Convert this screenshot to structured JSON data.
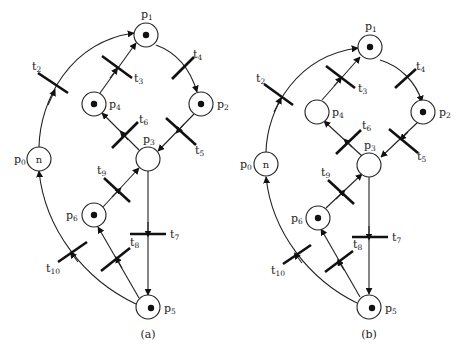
{
  "figure": {
    "type": "petri-net-comparison",
    "panels": [
      {
        "caption": "(a)",
        "places": [
          {
            "id": "p0",
            "name": "p",
            "sub": "0",
            "tokens": "n"
          },
          {
            "id": "p1",
            "name": "p",
            "sub": "1",
            "tokens": 1
          },
          {
            "id": "p2",
            "name": "p",
            "sub": "2",
            "tokens": 1
          },
          {
            "id": "p3",
            "name": "p",
            "sub": "3",
            "tokens": 0
          },
          {
            "id": "p4",
            "name": "p",
            "sub": "4",
            "tokens": 1
          },
          {
            "id": "p5",
            "name": "p",
            "sub": "5",
            "tokens": 1
          },
          {
            "id": "p6",
            "name": "p",
            "sub": "6",
            "tokens": 1
          }
        ]
      },
      {
        "caption": "(b)",
        "places": [
          {
            "id": "p0",
            "name": "p",
            "sub": "0",
            "tokens": "n"
          },
          {
            "id": "p1",
            "name": "p",
            "sub": "1",
            "tokens": 1
          },
          {
            "id": "p2",
            "name": "p",
            "sub": "2",
            "tokens": 1
          },
          {
            "id": "p3",
            "name": "p",
            "sub": "3",
            "tokens": 0
          },
          {
            "id": "p4",
            "name": "p",
            "sub": "4",
            "tokens": 0
          },
          {
            "id": "p5",
            "name": "p",
            "sub": "5",
            "tokens": 1
          },
          {
            "id": "p6",
            "name": "p",
            "sub": "6",
            "tokens": 1
          }
        ]
      }
    ],
    "transitions": [
      {
        "id": "t2",
        "name": "t",
        "sub": "2",
        "from": "p0",
        "to": "p1"
      },
      {
        "id": "t3",
        "name": "t",
        "sub": "3",
        "from": "p4",
        "to": "p1"
      },
      {
        "id": "t4",
        "name": "t",
        "sub": "4",
        "from": "p1",
        "to": "p2"
      },
      {
        "id": "t5",
        "name": "t",
        "sub": "5",
        "from": "p2",
        "to": "p3"
      },
      {
        "id": "t6",
        "name": "t",
        "sub": "6",
        "from": "p3",
        "to": "p4"
      },
      {
        "id": "t7",
        "name": "t",
        "sub": "7",
        "from": "p3",
        "to": "p5"
      },
      {
        "id": "t8",
        "name": "t",
        "sub": "8",
        "from": "p5",
        "to": "p6"
      },
      {
        "id": "t9",
        "name": "t",
        "sub": "9",
        "from": "p6",
        "to": "p3"
      },
      {
        "id": "t10",
        "name": "t",
        "sub": "10",
        "from": "p5",
        "to": "p0"
      }
    ]
  },
  "labels": {
    "a": {
      "p0": "p",
      "p0s": "0",
      "p0tok": "n",
      "p1": "p",
      "p1s": "1",
      "p2": "p",
      "p2s": "2",
      "p3": "p",
      "p3s": "3",
      "p4": "p",
      "p4s": "4",
      "p5": "p",
      "p5s": "5",
      "p6": "p",
      "p6s": "6",
      "t2": "t",
      "t2s": "2",
      "t3": "t",
      "t3s": "3",
      "t4": "t",
      "t4s": "4",
      "t5": "t",
      "t5s": "5",
      "t6": "t",
      "t6s": "6",
      "t7": "t",
      "t7s": "7",
      "t8": "t",
      "t8s": "8",
      "t9": "t",
      "t9s": "9",
      "t10": "t",
      "t10s": "10",
      "caption": "(a)"
    },
    "b": {
      "p0": "p",
      "p0s": "0",
      "p0tok": "n",
      "p1": "p",
      "p1s": "1",
      "p2": "p",
      "p2s": "2",
      "p3": "p",
      "p3s": "3",
      "p4": "p",
      "p4s": "4",
      "p5": "p",
      "p5s": "5",
      "p6": "p",
      "p6s": "6",
      "t2": "t",
      "t2s": "2",
      "t3": "t",
      "t3s": "3",
      "t4": "t",
      "t4s": "4",
      "t5": "t",
      "t5s": "5",
      "t6": "t",
      "t6s": "6",
      "t7": "t",
      "t7s": "7",
      "t8": "t",
      "t8s": "8",
      "t9": "t",
      "t9s": "9",
      "t10": "t",
      "t10s": "10",
      "caption": "(b)"
    }
  }
}
